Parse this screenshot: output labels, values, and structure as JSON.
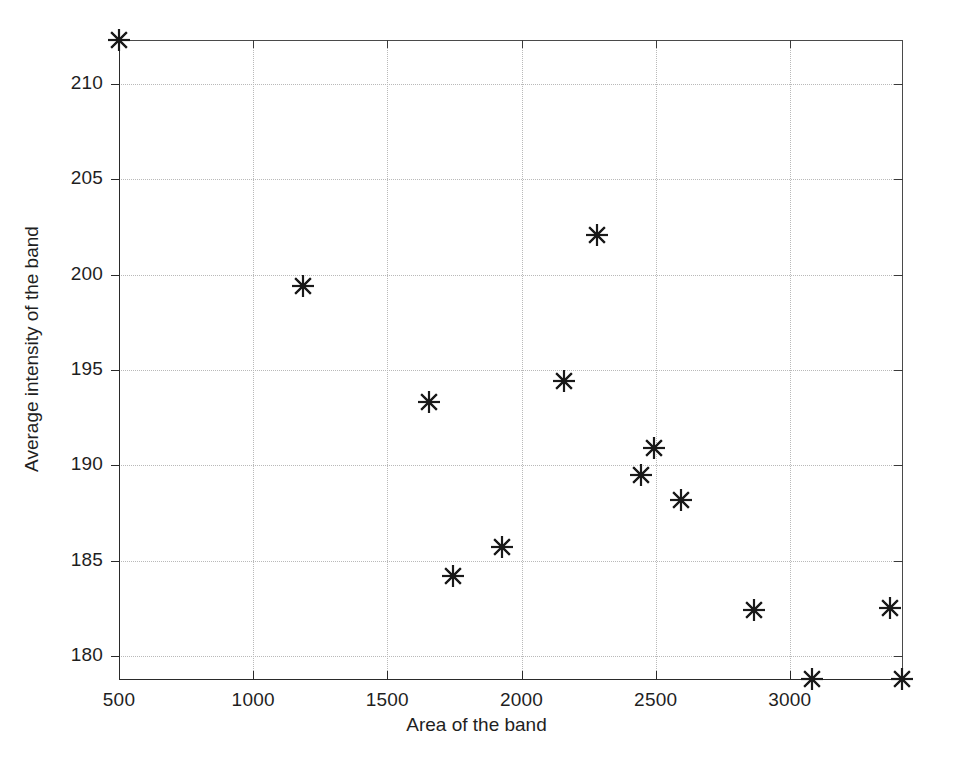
{
  "chart_data": {
    "type": "scatter",
    "title": "",
    "xlabel": "Area of the band",
    "ylabel": "Average intensity of the band",
    "marker": "asterisk",
    "marker_color": "#1a1a1a",
    "grid": true,
    "legend": null,
    "xlim": [
      500,
      3418
    ],
    "ylim": [
      178.8,
      212.3
    ],
    "xticks": [
      500,
      1000,
      1500,
      2000,
      2500,
      3000
    ],
    "yticks": [
      180,
      185,
      190,
      195,
      200,
      205,
      210
    ],
    "xtick_labels": [
      "500",
      "1000",
      "1500",
      "2000",
      "2500",
      "3000"
    ],
    "ytick_labels": [
      "180",
      "185",
      "190",
      "195",
      "200",
      "205",
      "210"
    ],
    "x": [
      500,
      1184,
      1656,
      1746,
      1928,
      2158,
      2283,
      2446,
      2494,
      2595,
      2866,
      3084,
      3375,
      3418
    ],
    "y": [
      212.3,
      199.4,
      193.3,
      184.2,
      185.7,
      194.4,
      202.1,
      189.5,
      190.9,
      188.2,
      182.4,
      178.8,
      182.5,
      178.8
    ],
    "points": [
      {
        "x": 500,
        "y": 212.3
      },
      {
        "x": 1184,
        "y": 199.4
      },
      {
        "x": 1656,
        "y": 193.3
      },
      {
        "x": 1746,
        "y": 184.2
      },
      {
        "x": 1928,
        "y": 185.7
      },
      {
        "x": 2158,
        "y": 194.4
      },
      {
        "x": 2283,
        "y": 202.1
      },
      {
        "x": 2446,
        "y": 189.5
      },
      {
        "x": 2494,
        "y": 190.9
      },
      {
        "x": 2595,
        "y": 188.2
      },
      {
        "x": 2866,
        "y": 182.4
      },
      {
        "x": 3084,
        "y": 178.8
      },
      {
        "x": 3375,
        "y": 182.5
      },
      {
        "x": 3418,
        "y": 178.8
      }
    ]
  },
  "figure": {
    "background": "#ffffff",
    "axis_color": "#2a2a2a",
    "grid_color": "#b9b9b9"
  }
}
